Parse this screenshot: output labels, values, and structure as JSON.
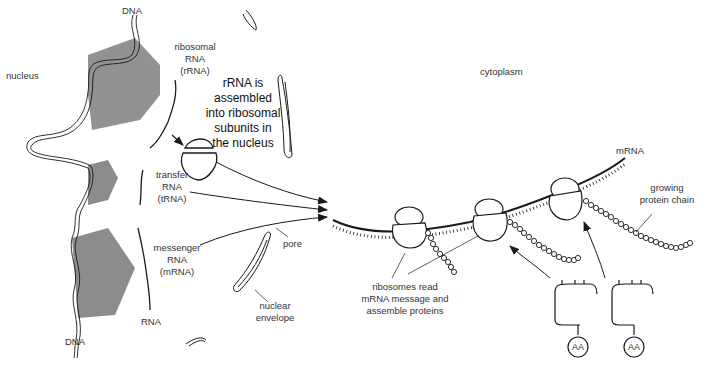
{
  "diagram": {
    "regions": {
      "nucleus": "nucleus",
      "cytoplasm": "cytoplasm"
    },
    "labels": {
      "dna_top": "DNA",
      "dna_bottom": "DNA",
      "rrna": [
        "ribosomal",
        "RNA",
        "(rRNA)"
      ],
      "rrna_note": [
        "rRNA is",
        "assembled",
        "into ribosomal",
        "subunits in",
        "the nucleus"
      ],
      "trna": [
        "transfer",
        "RNA",
        "(tRNA)"
      ],
      "mrna_nucleus": [
        "messenger",
        "RNA",
        "(mRNA)"
      ],
      "rna": "RNA",
      "pore": "pore",
      "nuclear_envelope": [
        "nuclear",
        "envelope"
      ],
      "mrna_cytoplasm": "mRNA",
      "growing_protein_chain": [
        "growing",
        "protein chain"
      ],
      "ribosomes_read": [
        "ribosomes read",
        "mRNA message and",
        "assemble proteins"
      ],
      "amino_acid_1": "AA",
      "amino_acid_2": "AA"
    },
    "colors": {
      "line": "#1a1a1a",
      "transcription_shading": "#8c8c8c",
      "background": "#ffffff"
    }
  }
}
